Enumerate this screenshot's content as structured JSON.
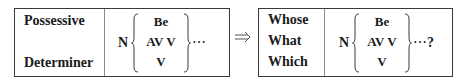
{
  "left_box": {
    "labels": [
      "Possessive",
      "Determiner"
    ],
    "formula": {
      "head": "N",
      "options": [
        "Be",
        "AV V",
        "V"
      ],
      "tail": "⋯"
    }
  },
  "transform_arrow": "⇒",
  "right_box": {
    "labels": [
      "Whose",
      "What",
      "Which"
    ],
    "formula": {
      "head": "N",
      "options": [
        "Be",
        "AV V",
        "V"
      ],
      "tail": "⋯",
      "question_mark": "?"
    }
  },
  "colors": {
    "border": "#3a3a3a",
    "divider": "#8a8a8a",
    "text": "#1a1a1a"
  }
}
